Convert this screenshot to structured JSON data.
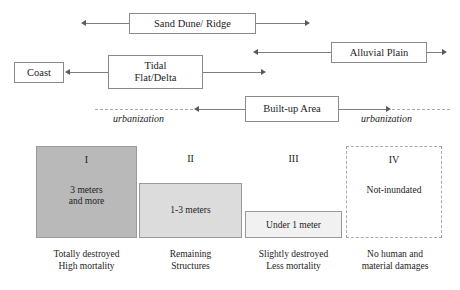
{
  "diagram": {
    "flow": {
      "nodes": [
        {
          "id": "sand-dune-ridge",
          "label": "Sand Dune/ Ridge"
        },
        {
          "id": "coast",
          "label": "Coast"
        },
        {
          "id": "tidal-flat-delta",
          "label": "Tidal",
          "label2": "Flat/Delta"
        },
        {
          "id": "alluvial-plain",
          "label": "Alluvial Plain"
        },
        {
          "id": "built-up-area",
          "label": "Built-up Area"
        }
      ],
      "annotations": [
        {
          "id": "urbanization-left",
          "label": "urbanization"
        },
        {
          "id": "urbanization-right",
          "label": "urbanization"
        }
      ]
    },
    "inundation": {
      "zones": [
        {
          "roman": "I",
          "depth": "3 meters",
          "depth2": "and more",
          "caption": "Totally destroyed",
          "caption2": "High mortality",
          "fill": "#b9b9b9",
          "inundated": true
        },
        {
          "roman": "II",
          "depth": "1-3 meters",
          "depth2": "",
          "caption": "Remaining",
          "caption2": "Structures",
          "fill": "#dcdcdc",
          "inundated": true
        },
        {
          "roman": "III",
          "depth": "Under 1 meter",
          "depth2": "",
          "caption": "Slightly destroyed",
          "caption2": "Less mortality",
          "fill": "#f1f1f1",
          "inundated": true
        },
        {
          "roman": "IV",
          "depth": "Not-inundated",
          "depth2": "",
          "caption": "No human and",
          "caption2": "material damages",
          "fill": "#ffffff",
          "inundated": false
        }
      ]
    },
    "colors": {
      "line": "#7d7d7d",
      "box_border": "#8a8a8a",
      "dashed": "#a9a9a9",
      "text": "#1c1c1c"
    }
  }
}
